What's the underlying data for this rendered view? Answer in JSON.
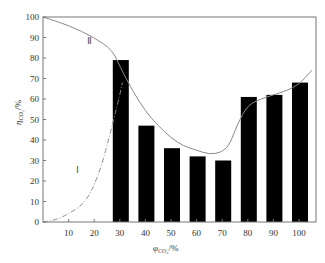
{
  "chart_data": {
    "type": "bar",
    "title": "",
    "xlabel": "φ_CO2/%",
    "ylabel": "η_CO2/%",
    "ylim": [
      0,
      100
    ],
    "xlim": [
      0,
      105
    ],
    "yticks": [
      0,
      10,
      20,
      30,
      40,
      50,
      60,
      70,
      80,
      90,
      100
    ],
    "xticks": [
      10,
      20,
      30,
      40,
      50,
      60,
      70,
      80,
      90,
      100
    ],
    "categories": [
      "30",
      "40",
      "50",
      "60",
      "70",
      "80",
      "90",
      "100"
    ],
    "series": [
      {
        "name": "bars",
        "values": [
          79,
          47,
          36,
          32,
          30,
          61,
          62,
          68
        ],
        "color": "#000000"
      }
    ],
    "curves": [
      {
        "name": "boundary-II",
        "style": "solid",
        "color": "#8a8a8a",
        "x": [
          0,
          10,
          20,
          27,
          30,
          35,
          40,
          45,
          50,
          55,
          60,
          65,
          70,
          73,
          76,
          80,
          85,
          90,
          95,
          100,
          105
        ],
        "y": [
          100,
          96,
          90,
          84,
          76,
          64,
          54,
          47,
          41,
          37,
          35,
          33,
          34,
          38,
          48,
          57,
          60,
          62,
          64,
          67,
          74
        ]
      },
      {
        "name": "boundary-I",
        "style": "dash-dot",
        "color": "#8a8a8a",
        "x": [
          0,
          5,
          10,
          15,
          18,
          20,
          23,
          26,
          28,
          30,
          31
        ],
        "y": [
          0,
          1,
          4,
          8,
          13,
          18,
          28,
          42,
          52,
          62,
          68
        ]
      }
    ],
    "annotations": [
      {
        "text": "Ⅱ",
        "x": 17,
        "y": 87
      },
      {
        "text": "Ⅰ",
        "x": 13,
        "y": 24
      }
    ],
    "grid": false,
    "legend": null
  },
  "labels": {
    "xlabel_main": "φ",
    "xlabel_sub": "CO₂",
    "xlabel_unit": "/%",
    "ylabel_main": "η",
    "ylabel_sub": "CO₂",
    "ylabel_unit": "/%",
    "region_II": "Ⅱ",
    "region_I": "Ⅰ"
  }
}
